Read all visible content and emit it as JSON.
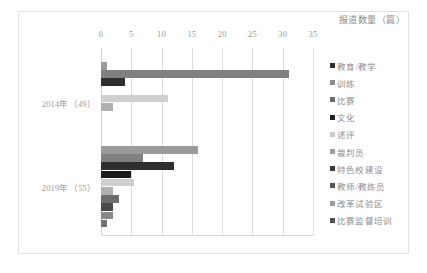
{
  "chart_data": {
    "type": "bar",
    "orientation": "horizontal",
    "title": "报道数量（篇）",
    "xlabel": "",
    "ylabel": "",
    "xlim": [
      0,
      35
    ],
    "xticks": [
      0,
      5,
      10,
      15,
      20,
      25,
      30,
      35
    ],
    "grid": true,
    "legend_position": "right",
    "categories": [
      "2014年（49）",
      "2019年（55）"
    ],
    "series": [
      {
        "name": "教育/教学",
        "color": "#9b9b9b",
        "values": [
          1,
          16
        ]
      },
      {
        "name": "训练",
        "color": "#808080",
        "values": [
          31,
          7
        ]
      },
      {
        "name": "比赛",
        "color": "#2f2f2f",
        "values": [
          4,
          12
        ]
      },
      {
        "name": "文化",
        "color": "#1a1a1a",
        "values": [
          0,
          5
        ]
      },
      {
        "name": "述评",
        "color": "#cfcfcf",
        "values": [
          11,
          5.5
        ]
      },
      {
        "name": "裁判员",
        "color": "#b0b0b0",
        "values": [
          2,
          2
        ]
      },
      {
        "name": "特色校建设",
        "color": "#6e6e6e",
        "values": [
          0,
          3
        ]
      },
      {
        "name": "教师/教练员",
        "color": "#4a4a4a",
        "values": [
          0,
          2
        ]
      },
      {
        "name": "改革试验区",
        "color": "#8a8a8a",
        "values": [
          0,
          2
        ]
      },
      {
        "name": "比赛监督培训",
        "color": "#707070",
        "values": [
          0,
          1
        ]
      }
    ]
  },
  "legend": {
    "items": [
      {
        "label": "教育/教学",
        "color": "#2f2f2f"
      },
      {
        "label": "训练",
        "color": "#8e8e8e"
      },
      {
        "label": "比赛",
        "color": "#6b6b6b"
      },
      {
        "label": "文化",
        "color": "#1f1f1f"
      },
      {
        "label": "述评",
        "color": "#cbcbcb"
      },
      {
        "label": "裁判员",
        "color": "#9e9e9e"
      },
      {
        "label": "特色校建设",
        "color": "#3a3a3a"
      },
      {
        "label": "教师/教练员",
        "color": "#555555"
      },
      {
        "label": "改革试验区",
        "color": "#9a9a9a"
      },
      {
        "label": "比赛监督培训",
        "color": "#4f4f4f"
      }
    ]
  },
  "axis": {
    "tick_0": "0",
    "tick_1": "5",
    "tick_2": "10",
    "tick_3": "15",
    "tick_4": "20",
    "tick_5": "25",
    "tick_6": "30",
    "tick_7": "35"
  },
  "groups": {
    "group_2014": "2014年（49）",
    "group_2019": "2019年（55）"
  }
}
